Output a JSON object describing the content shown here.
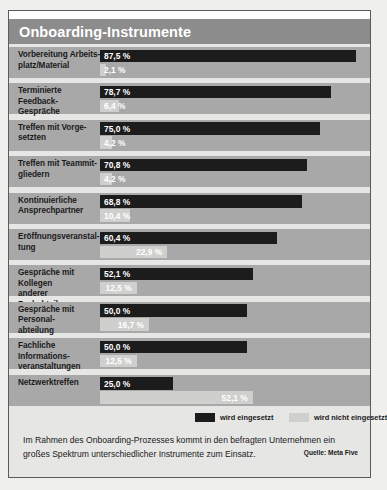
{
  "title": "Onboarding-Instrumente",
  "legend": {
    "used": {
      "label": "wird eingesetzt",
      "color": "#1c1c1c"
    },
    "not_used": {
      "label": "wird nicht eingesetzt",
      "color": "#cfcfcd"
    }
  },
  "footer": {
    "text": "Im Rahmen des Onboarding-Prozesses kommt in den befragten Unternehmen ein großes Spektrum unterschiedlicher Instrumente zum Einsatz.",
    "source": "Quelle: Meta Five"
  },
  "chart_data": {
    "type": "bar",
    "orientation": "horizontal",
    "title": "Onboarding-Instrumente",
    "xlabel": "",
    "ylabel": "",
    "xlim": [
      0,
      100
    ],
    "unit": "%",
    "grid": false,
    "legend_position": "bottom-right",
    "categories": [
      "Vorbereitung Arbeits-platz/Material",
      "Terminierte Feedback-Gespräche",
      "Treffen mit Vorge-setzten",
      "Treffen mit Teammit-gliedern",
      "Kontinuierliche Ansprechpartner",
      "Eröffnungsveranstal-tung",
      "Gespräche mit Kollegen anderer Fachabteilungen",
      "Gespräche mit Personal-abteilung",
      "Fachliche Informations-veranstaltungen",
      "Netzwerktreffen"
    ],
    "series": [
      {
        "name": "wird eingesetzt",
        "color": "#1c1c1c",
        "values": [
          87.5,
          78.7,
          75.0,
          70.8,
          68.8,
          60.4,
          52.1,
          50.0,
          50.0,
          25.0
        ],
        "labels": [
          "87,5 %",
          "78,7 %",
          "75,0 %",
          "70,8 %",
          "68,8 %",
          "60,4 %",
          "52,1 %",
          "50,0 %",
          "50,0 %",
          "25,0 %"
        ]
      },
      {
        "name": "wird nicht eingesetzt",
        "color": "#cfcfcd",
        "values": [
          2.1,
          6.4,
          4.2,
          4.2,
          10.4,
          22.9,
          12.5,
          16.7,
          12.5,
          52.1
        ],
        "labels": [
          "2,1 %",
          "6,4 %",
          "4,2 %",
          "4,2 %",
          "10,4 %",
          "22,9 %",
          "12,5 %",
          "16,7 %",
          "12,5 %",
          "52,1 %"
        ]
      }
    ]
  },
  "rows": [
    {
      "line1": "Vorbereitung Arbeits-",
      "line2": "platz/Material",
      "black": 87.5,
      "black_label": "87,5 %",
      "gray": 2.1,
      "gray_label": "2,1 %"
    },
    {
      "line1": "Terminierte Feedback-",
      "line2": "Gespräche",
      "black": 78.7,
      "black_label": "78,7 %",
      "gray": 6.4,
      "gray_label": "6,4 %"
    },
    {
      "line1": "Treffen mit Vorge-",
      "line2": "setzten",
      "black": 75.0,
      "black_label": "75,0 %",
      "gray": 4.2,
      "gray_label": "4,2 %"
    },
    {
      "line1": "Treffen mit Teammit-",
      "line2": "gliedern",
      "black": 70.8,
      "black_label": "70,8 %",
      "gray": 4.2,
      "gray_label": "4,2 %"
    },
    {
      "line1": "Kontinuierliche",
      "line2": "Ansprechpartner",
      "black": 68.8,
      "black_label": "68,8 %",
      "gray": 10.4,
      "gray_label": "10,4 %"
    },
    {
      "line1": "Eröffnungsveranstal-",
      "line2": "tung",
      "black": 60.4,
      "black_label": "60,4 %",
      "gray": 22.9,
      "gray_label": "22,9 %"
    },
    {
      "line1": "Gespräche mit Kollegen",
      "line2": "anderer Fachabteilungen",
      "black": 52.1,
      "black_label": "52,1 %",
      "gray": 12.5,
      "gray_label": "12,5 %"
    },
    {
      "line1": "Gespräche mit Personal-",
      "line2": "abteilung",
      "black": 50.0,
      "black_label": "50,0 %",
      "gray": 16.7,
      "gray_label": "16,7 %"
    },
    {
      "line1": "Fachliche Informations-",
      "line2": "veranstaltungen",
      "black": 50.0,
      "black_label": "50,0 %",
      "gray": 12.5,
      "gray_label": "12,5 %"
    },
    {
      "line1": "Netzwerktreffen",
      "line2": "",
      "black": 25.0,
      "black_label": "25,0 %",
      "gray": 52.1,
      "gray_label": "52,1 %"
    }
  ]
}
